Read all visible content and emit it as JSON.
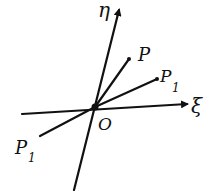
{
  "diagram": {
    "type": "coordinate-axes-sketch",
    "axes": [
      {
        "id": "eta",
        "label": "η",
        "direction": "vertical-tilted",
        "arrow": "up"
      },
      {
        "id": "xi",
        "label": "ξ",
        "direction": "horizontal",
        "arrow": "right"
      }
    ],
    "origin": {
      "label": "O"
    },
    "points": [
      {
        "id": "P",
        "label": "P"
      },
      {
        "id": "P1",
        "label": "P",
        "subscript": "1"
      },
      {
        "id": "P1-reflected",
        "label": "P",
        "subscript": "1"
      }
    ],
    "colors": {
      "ink": "#111111",
      "background": "#ffffff"
    }
  }
}
